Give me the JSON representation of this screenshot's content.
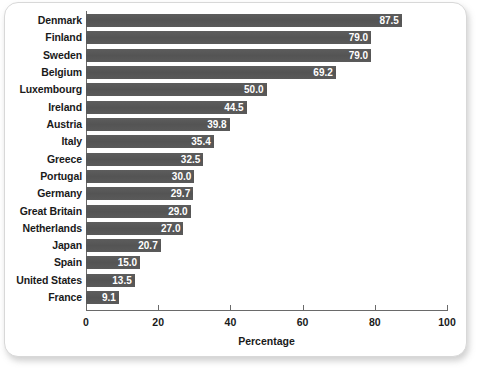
{
  "chart_data": {
    "type": "bar",
    "orientation": "horizontal",
    "title": "",
    "xlabel": "Percentage",
    "ylabel": "",
    "xlim": [
      0,
      100
    ],
    "xticks": [
      0,
      20,
      40,
      60,
      80,
      100
    ],
    "xtick_labels": [
      "0",
      "20",
      "40",
      "60",
      "80",
      "100"
    ],
    "grid": false,
    "legend": null,
    "bar_color": "#595959",
    "value_label_color": "#ffffff",
    "categories": [
      "Denmark",
      "Finland",
      "Sweden",
      "Belgium",
      "Luxembourg",
      "Ireland",
      "Austria",
      "Italy",
      "Greece",
      "Portugal",
      "Germany",
      "Great Britain",
      "Netherlands",
      "Japan",
      "Spain",
      "United States",
      "France"
    ],
    "values": [
      87.5,
      79.0,
      79.0,
      69.2,
      50.0,
      44.5,
      39.8,
      35.4,
      32.5,
      30.0,
      29.7,
      29.0,
      27.0,
      20.7,
      15.0,
      13.5,
      9.1
    ],
    "value_labels": [
      "87.5",
      "79.0",
      "79.0",
      "69.2",
      "50.0",
      "44.5",
      "39.8",
      "35.4",
      "32.5",
      "30.0",
      "29.7",
      "29.0",
      "27.0",
      "20.7",
      "15.0",
      "13.5",
      "9.1"
    ]
  }
}
